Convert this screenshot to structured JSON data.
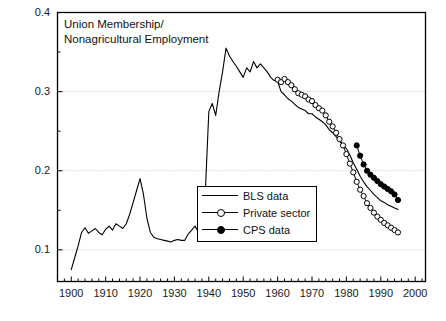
{
  "chart_data": {
    "type": "line",
    "title": "Union Membership/ Nonagricultural Employment",
    "title_line1": "Union Membership/",
    "title_line2": "Nonagricultural Employment",
    "xlabel": "",
    "ylabel": "",
    "xlim": [
      1896,
      2003
    ],
    "ylim": [
      0.06,
      0.4
    ],
    "grid": true,
    "grid_values": [
      0.1,
      0.2,
      0.3
    ],
    "legend_position": "center-right-inside",
    "xticks": [
      1900,
      1910,
      1920,
      1930,
      1940,
      1950,
      1960,
      1970,
      1980,
      1990,
      2000
    ],
    "xtick_labels": [
      "1900",
      "1910",
      "1920",
      "1930",
      "1940",
      "1950",
      "1960",
      "1970",
      "1980",
      "1990",
      "2000"
    ],
    "xminor_step": 2,
    "yticks": [
      0.1,
      0.2,
      0.3,
      0.4
    ],
    "ytick_labels": [
      "0.1",
      "0.2",
      "0.3",
      "0.4"
    ],
    "yminor": [
      0.15,
      0.25,
      0.35
    ],
    "line_color": "#000000",
    "series": [
      {
        "name": "BLS data",
        "marker": "none",
        "x": [
          1900,
          1901,
          1902,
          1903,
          1904,
          1905,
          1906,
          1907,
          1908,
          1909,
          1910,
          1911,
          1912,
          1913,
          1914,
          1915,
          1916,
          1917,
          1918,
          1919,
          1920,
          1921,
          1922,
          1923,
          1924,
          1925,
          1926,
          1927,
          1928,
          1929,
          1930,
          1931,
          1932,
          1933,
          1934,
          1935,
          1936,
          1937,
          1938,
          1939,
          1940,
          1941,
          1942,
          1943,
          1944,
          1945,
          1946,
          1947,
          1948,
          1949,
          1950,
          1951,
          1952,
          1953,
          1954,
          1955,
          1956,
          1957,
          1958,
          1959,
          1960,
          1961,
          1962,
          1963,
          1964,
          1965,
          1966,
          1967,
          1968,
          1969,
          1970,
          1971,
          1972,
          1973,
          1974,
          1975,
          1976,
          1977,
          1978,
          1979,
          1980,
          1981,
          1982,
          1983,
          1984,
          1985,
          1986,
          1987,
          1988,
          1989,
          1990,
          1991,
          1992,
          1993,
          1994,
          1995
        ],
        "y": [
          0.075,
          0.09,
          0.105,
          0.122,
          0.128,
          0.121,
          0.124,
          0.127,
          0.122,
          0.119,
          0.126,
          0.13,
          0.125,
          0.133,
          0.13,
          0.127,
          0.133,
          0.145,
          0.16,
          0.175,
          0.19,
          0.17,
          0.14,
          0.122,
          0.116,
          0.114,
          0.113,
          0.112,
          0.111,
          0.11,
          0.112,
          0.113,
          0.112,
          0.112,
          0.12,
          0.125,
          0.13,
          0.122,
          0.14,
          0.175,
          0.275,
          0.285,
          0.27,
          0.3,
          0.325,
          0.355,
          0.345,
          0.338,
          0.332,
          0.325,
          0.318,
          0.33,
          0.325,
          0.338,
          0.33,
          0.335,
          0.33,
          0.325,
          0.318,
          0.314,
          0.313,
          0.3,
          0.296,
          0.291,
          0.288,
          0.284,
          0.28,
          0.278,
          0.276,
          0.272,
          0.272,
          0.268,
          0.265,
          0.262,
          0.258,
          0.252,
          0.248,
          0.243,
          0.238,
          0.232,
          0.228,
          0.22,
          0.21,
          0.202,
          0.193,
          0.186,
          0.18,
          0.175,
          0.17,
          0.166,
          0.162,
          0.16,
          0.157,
          0.155,
          0.153,
          0.151
        ]
      },
      {
        "name": "Private sector",
        "marker": "open-circle",
        "x": [
          1960,
          1961,
          1962,
          1963,
          1964,
          1965,
          1966,
          1967,
          1968,
          1969,
          1970,
          1971,
          1972,
          1973,
          1974,
          1975,
          1976,
          1977,
          1978,
          1979,
          1980,
          1981,
          1982,
          1983,
          1984,
          1985,
          1986,
          1987,
          1988,
          1989,
          1990,
          1991,
          1992,
          1993,
          1994,
          1995
        ],
        "y": [
          0.315,
          0.312,
          0.316,
          0.312,
          0.308,
          0.303,
          0.298,
          0.296,
          0.294,
          0.29,
          0.288,
          0.283,
          0.279,
          0.276,
          0.27,
          0.262,
          0.256,
          0.248,
          0.24,
          0.232,
          0.221,
          0.209,
          0.198,
          0.186,
          0.176,
          0.168,
          0.159,
          0.153,
          0.147,
          0.142,
          0.138,
          0.134,
          0.131,
          0.128,
          0.125,
          0.122
        ]
      },
      {
        "name": "CPS data",
        "marker": "filled-circle",
        "x": [
          1983,
          1984,
          1985,
          1986,
          1987,
          1988,
          1989,
          1990,
          1991,
          1992,
          1993,
          1994,
          1995
        ],
        "y": [
          0.232,
          0.219,
          0.208,
          0.2,
          0.195,
          0.191,
          0.187,
          0.183,
          0.18,
          0.177,
          0.174,
          0.17,
          0.163
        ]
      }
    ]
  },
  "legend": {
    "items": [
      {
        "label": "BLS data",
        "marker": "none"
      },
      {
        "label": "Private sector",
        "marker": "open-circle"
      },
      {
        "label": "CPS data",
        "marker": "filled-circle"
      }
    ]
  }
}
